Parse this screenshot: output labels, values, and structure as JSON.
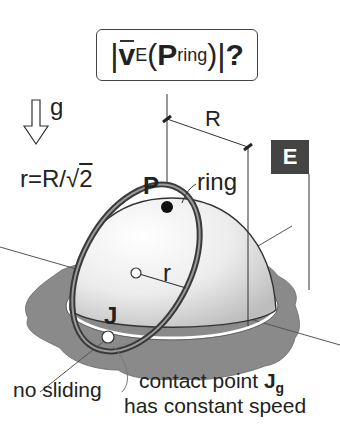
{
  "title": {
    "abs_bar_left": "|",
    "vector": "v",
    "vector_sub": "E",
    "paren_open": "(",
    "point": "P",
    "point_sub": "ring",
    "paren_close": ")",
    "abs_bar_right": "|",
    "question": "?"
  },
  "labels": {
    "gravity": "g",
    "radius_relation_lhs": "r",
    "radius_relation_eq": "=",
    "radius_relation_rhs": "R/",
    "sqrt_arg": "2",
    "big_radius": "R",
    "frame_badge": "E",
    "point_P": "P",
    "ring": "ring",
    "small_radius": "r",
    "point_J": "J",
    "no_sliding": "no sliding",
    "contact_point_text": "contact point ",
    "contact_point_symbol": "J",
    "contact_point_sub": "g",
    "constant_speed": "has constant speed"
  },
  "colors": {
    "ground": "#8a8a8a",
    "dome_light": "#f4f4f4",
    "dome_shade": "#c9c9c9",
    "ring": "#3a3a3a",
    "badge": "#444444",
    "ink": "#222222"
  }
}
